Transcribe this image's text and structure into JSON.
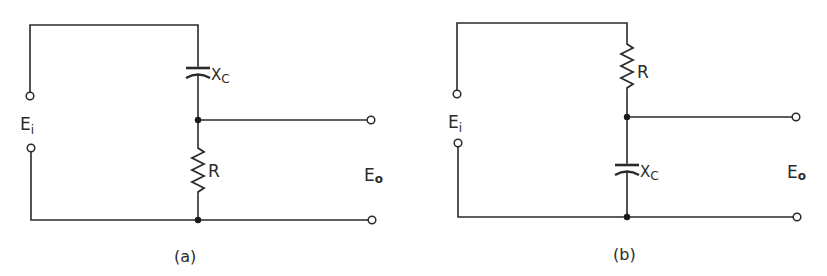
{
  "figure": {
    "circuit_a": {
      "caption": "(a)",
      "input_label": "E",
      "input_sub": "i",
      "output_label": "E",
      "output_sub": "o",
      "series_component": {
        "type": "capacitor",
        "label": "X",
        "sub": "C"
      },
      "shunt_component": {
        "type": "resistor",
        "label": "R"
      }
    },
    "circuit_b": {
      "caption": "(b)",
      "input_label": "E",
      "input_sub": "i",
      "output_label": "E",
      "output_sub": "o",
      "series_component": {
        "type": "resistor",
        "label": "R"
      },
      "shunt_component": {
        "type": "capacitor",
        "label": "X",
        "sub": "C"
      }
    }
  }
}
